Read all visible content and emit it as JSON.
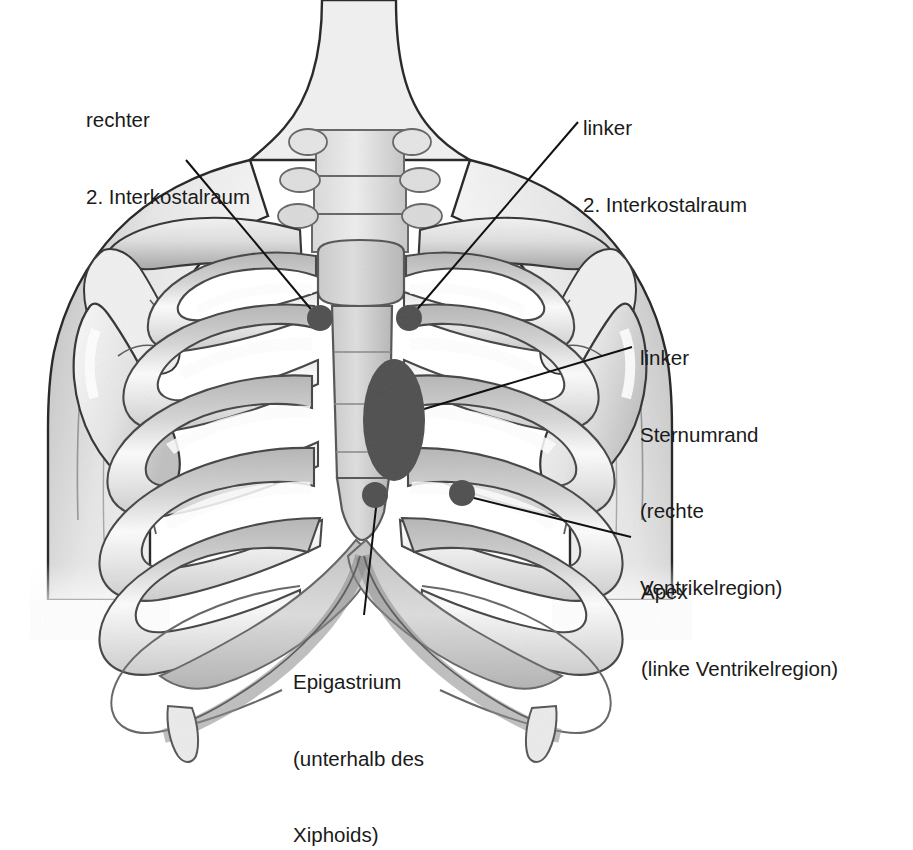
{
  "figure": {
    "kind": "anatomical-illustration",
    "background_color": "#ffffff",
    "line_color": "#1a1a1a",
    "marker_color": "#5a5a5a",
    "bone_fill_light": "#efefef",
    "bone_fill_mid": "#d9d9d9",
    "bone_shadow": "#b4b4b4",
    "skin_fill": "#ededed"
  },
  "labels": {
    "right_intercostal": {
      "line1": "rechter",
      "line2": "2. Interkostalraum"
    },
    "left_intercostal": {
      "line1": "linker",
      "line2": "2. Interkostalraum"
    },
    "left_sternal_border": {
      "line1": "linker",
      "line2": "Sternumrand",
      "line3": "(rechte",
      "line4": "Ventrikelregion)"
    },
    "apex": {
      "line1": "Apex",
      "line2": "(linke Ventrikelregion)"
    },
    "epigastrium": {
      "line1": "Epigastrium",
      "line2": "(unterhalb des",
      "line3": "Xiphoids)"
    }
  },
  "markers": [
    {
      "name": "right-2nd-intercostal-space",
      "shape": "circle",
      "cx": 320,
      "cy": 318,
      "r": 13
    },
    {
      "name": "left-2nd-intercostal-space",
      "shape": "circle",
      "cx": 409,
      "cy": 318,
      "r": 13
    },
    {
      "name": "left-sternal-border-region",
      "shape": "ellipse",
      "cx": 394,
      "cy": 420,
      "rx": 31,
      "ry": 61
    },
    {
      "name": "epigastrium-point",
      "shape": "circle",
      "cx": 375,
      "cy": 495,
      "r": 13
    },
    {
      "name": "apex-point",
      "shape": "circle",
      "cx": 462,
      "cy": 493,
      "r": 13
    }
  ],
  "leader_lines": [
    {
      "name": "leader-right-intercostal",
      "x1": 186,
      "y1": 160,
      "x2": 315,
      "y2": 314
    },
    {
      "name": "leader-left-intercostal",
      "x1": 578,
      "y1": 122,
      "x2": 414,
      "y2": 313
    },
    {
      "name": "leader-left-sternal-border",
      "x1": 632,
      "y1": 347,
      "x2": 404,
      "y2": 415
    },
    {
      "name": "leader-apex",
      "x1": 631,
      "y1": 537,
      "x2": 466,
      "y2": 496
    },
    {
      "name": "leader-epigastrium",
      "x1": 364,
      "y1": 615,
      "x2": 377,
      "y2": 499
    }
  ]
}
